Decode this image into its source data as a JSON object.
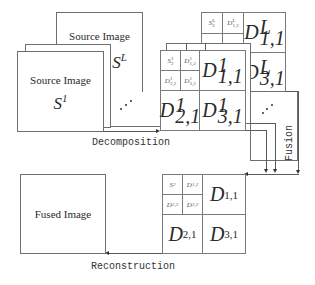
{
  "source_images": {
    "back": {
      "title": "Source Image",
      "symbol": "S",
      "superscript": "L"
    },
    "front": {
      "title": "Source Image",
      "symbol": "S",
      "superscript": "1"
    }
  },
  "decomposition_level_L": {
    "cells": {
      "s": {
        "base": "S",
        "sup": "L",
        "sub": "2"
      },
      "d12": {
        "base": "D",
        "sup": "L",
        "sub": "1,2"
      },
      "d11": {
        "base": "D",
        "sup": "L",
        "sub": "1,1"
      },
      "d31": {
        "base": "D",
        "sup": "L",
        "sub": "3,1"
      }
    }
  },
  "decomposition_level_1": {
    "cells": {
      "s": {
        "base": "S",
        "sup": "1",
        "sub": "2"
      },
      "d12": {
        "base": "D",
        "sup": "1",
        "sub": "1,2"
      },
      "d22": {
        "base": "D",
        "sup": "1",
        "sub": "2,2"
      },
      "d32": {
        "base": "D",
        "sup": "1",
        "sub": "3,2"
      },
      "d11": {
        "base": "D",
        "sup": "1",
        "sub": "1,1"
      },
      "d21": {
        "base": "D",
        "sup": "1",
        "sub": "2,1"
      },
      "d31": {
        "base": "D",
        "sup": "1",
        "sub": "3,1"
      }
    }
  },
  "fused_coefficients": {
    "cells": {
      "s": {
        "base": "S",
        "sub": "2"
      },
      "d12": {
        "base": "D",
        "sub": "1,2"
      },
      "d22": {
        "base": "D",
        "sub": "2,2"
      },
      "d32": {
        "base": "D",
        "sub": "3,2"
      },
      "d11": {
        "base": "D",
        "sub": "1,1"
      },
      "d21": {
        "base": "D",
        "sub": "2,1"
      },
      "d31": {
        "base": "D",
        "sub": "3,1"
      }
    }
  },
  "fused_image": {
    "title": "Fused Image"
  },
  "labels": {
    "decomposition": "Decomposition",
    "fusion": "Fusion",
    "reconstruction": "Reconstruction",
    "ellipsis": "⋰"
  }
}
